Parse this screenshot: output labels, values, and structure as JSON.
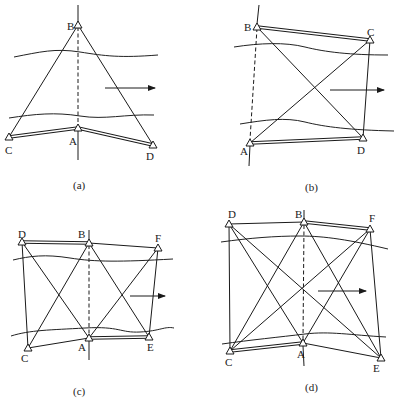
{
  "figure": {
    "panels": [
      {
        "id": "a",
        "caption": "(a)",
        "labels": {
          "B": "B",
          "A": "A",
          "C": "C",
          "D": "D"
        }
      },
      {
        "id": "b",
        "caption": "(b)",
        "labels": {
          "B": "B",
          "C": "C",
          "A": "A",
          "D": "D"
        }
      },
      {
        "id": "c",
        "caption": "(c)",
        "labels": {
          "D": "D",
          "B": "B",
          "F": "F",
          "C": "C",
          "A": "A",
          "E": "E"
        }
      },
      {
        "id": "d",
        "caption": "(d)",
        "labels": {
          "D": "D",
          "B": "B",
          "F": "F",
          "C": "C",
          "A": "A",
          "E": "E"
        }
      }
    ],
    "legend_semantics": {
      "triangle": "survey-station-icon",
      "double-line": "baseline",
      "dashed-line": "river-crossing-line",
      "arrow": "flow-direction-arrow",
      "wavy-lines": "river-banks"
    }
  }
}
